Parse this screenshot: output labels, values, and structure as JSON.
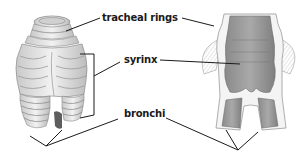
{
  "diagram": {
    "views": [
      {
        "id": "external",
        "description": "external view of syrinx with tracheal rings"
      },
      {
        "id": "cross-section",
        "description": "longitudinal cross-section of syrinx"
      }
    ],
    "labels": [
      {
        "id": "tracheal-rings",
        "text": "tracheal rings",
        "x": 102,
        "y": 12
      },
      {
        "id": "syrinx",
        "text": "syrinx",
        "x": 124,
        "y": 27
      },
      {
        "id": "bronchi",
        "text": "bronchi",
        "x": 124,
        "y": 108
      }
    ],
    "colors": {
      "tissue_light": "#e6e6e6",
      "tissue_shadow": "#a8a8a8",
      "tissue_dark": "#7e7e7e",
      "leader_line": "#1a1a1a"
    }
  }
}
